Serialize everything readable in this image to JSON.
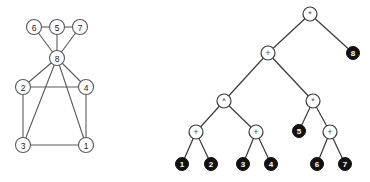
{
  "figure": {
    "title": "",
    "panels": [
      {
        "id": "graph",
        "name": "undirected-graph"
      },
      {
        "id": "tree",
        "name": "expression-tree"
      }
    ]
  },
  "colors": {
    "background": "#ffffff",
    "edge": "#5a5a5a",
    "tree_edge": "#3a3a3a",
    "open_node_fill": "#ffffff",
    "open_node_stroke": "#5a5a5a",
    "leaf_fill": "#111111",
    "leaf_text": "#ffffff",
    "node_text": "#222222",
    "operator_text": "#555555"
  },
  "graph": {
    "nodes": [
      {
        "id": "6",
        "label": "6",
        "cx": 34,
        "cy": 27
      },
      {
        "id": "5",
        "label": "5",
        "cx": 57,
        "cy": 27
      },
      {
        "id": "7",
        "label": "7",
        "cx": 80,
        "cy": 27
      },
      {
        "id": "8",
        "label": "8",
        "cx": 57,
        "cy": 58
      },
      {
        "id": "2",
        "label": "2",
        "cx": 23,
        "cy": 87
      },
      {
        "id": "4",
        "label": "4",
        "cx": 86,
        "cy": 87
      },
      {
        "id": "3",
        "label": "3",
        "cx": 23,
        "cy": 145
      },
      {
        "id": "1",
        "label": "1",
        "cx": 86,
        "cy": 145
      }
    ],
    "edges": [
      {
        "from": "6",
        "to": "5"
      },
      {
        "from": "5",
        "to": "7"
      },
      {
        "from": "6",
        "to": "8"
      },
      {
        "from": "5",
        "to": "8"
      },
      {
        "from": "7",
        "to": "8"
      },
      {
        "from": "8",
        "to": "2"
      },
      {
        "from": "8",
        "to": "4"
      },
      {
        "from": "8",
        "to": "3"
      },
      {
        "from": "8",
        "to": "1"
      },
      {
        "from": "2",
        "to": "4"
      },
      {
        "from": "2",
        "to": "3"
      },
      {
        "from": "4",
        "to": "1"
      },
      {
        "from": "3",
        "to": "1"
      }
    ],
    "node_radius": 7.5
  },
  "tree": {
    "nodes": [
      {
        "id": "r",
        "label": "*",
        "kind": "operator",
        "cx": 310,
        "cy": 14
      },
      {
        "id": "p",
        "label": "+",
        "kind": "operator",
        "cx": 268,
        "cy": 53
      },
      {
        "id": "l8",
        "label": "8",
        "kind": "leaf",
        "cx": 353,
        "cy": 53
      },
      {
        "id": "m1",
        "label": "*",
        "kind": "operator",
        "cx": 224,
        "cy": 101
      },
      {
        "id": "m2",
        "label": "*",
        "kind": "operator",
        "cx": 313,
        "cy": 101
      },
      {
        "id": "a1",
        "label": "+",
        "kind": "operator",
        "cx": 196,
        "cy": 132
      },
      {
        "id": "a2",
        "label": "+",
        "kind": "operator",
        "cx": 256,
        "cy": 132
      },
      {
        "id": "l5",
        "label": "5",
        "kind": "leaf",
        "cx": 299,
        "cy": 131
      },
      {
        "id": "a3",
        "label": "+",
        "kind": "operator",
        "cx": 330,
        "cy": 132
      },
      {
        "id": "l1",
        "label": "1",
        "kind": "leaf",
        "cx": 182,
        "cy": 164
      },
      {
        "id": "l2",
        "label": "2",
        "kind": "leaf",
        "cx": 211,
        "cy": 164
      },
      {
        "id": "l3",
        "label": "3",
        "kind": "leaf",
        "cx": 243,
        "cy": 164
      },
      {
        "id": "l4",
        "label": "4",
        "kind": "leaf",
        "cx": 271,
        "cy": 164
      },
      {
        "id": "l6",
        "label": "6",
        "kind": "leaf",
        "cx": 317,
        "cy": 164
      },
      {
        "id": "l7",
        "label": "7",
        "kind": "leaf",
        "cx": 345,
        "cy": 164
      }
    ],
    "edges": [
      {
        "from": "r",
        "to": "p"
      },
      {
        "from": "r",
        "to": "l8"
      },
      {
        "from": "p",
        "to": "m1"
      },
      {
        "from": "p",
        "to": "m2"
      },
      {
        "from": "m1",
        "to": "a1"
      },
      {
        "from": "m1",
        "to": "a2"
      },
      {
        "from": "m2",
        "to": "l5"
      },
      {
        "from": "m2",
        "to": "a3"
      },
      {
        "from": "a1",
        "to": "l1"
      },
      {
        "from": "a1",
        "to": "l2"
      },
      {
        "from": "a2",
        "to": "l3"
      },
      {
        "from": "a2",
        "to": "l4"
      },
      {
        "from": "a3",
        "to": "l6"
      },
      {
        "from": "a3",
        "to": "l7"
      }
    ],
    "operator_radius": 7,
    "leaf_radius": 6.5
  }
}
